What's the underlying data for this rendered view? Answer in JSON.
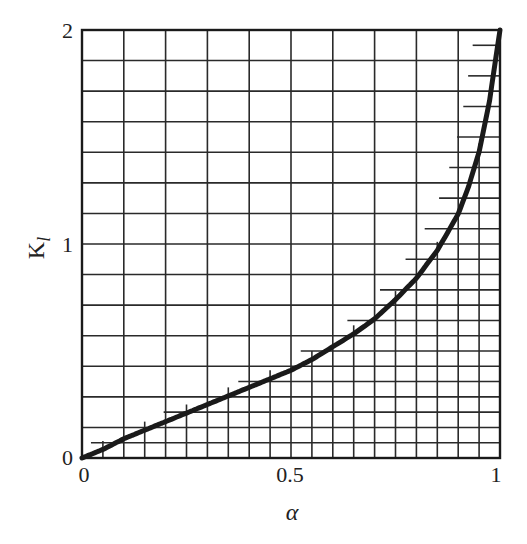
{
  "chart_data": {
    "type": "line",
    "title": "",
    "xlabel": "α",
    "ylabel": "K",
    "ylabel_subscript": "l",
    "xlim": [
      0,
      1
    ],
    "ylim": [
      0,
      2
    ],
    "x_ticks": [
      "0",
      "0.5",
      "1"
    ],
    "y_ticks": [
      "0",
      "1",
      "2"
    ],
    "grid": true,
    "grid_x_divisions": 10,
    "grid_y_divisions": 14,
    "fine_grid_under_curve": true,
    "series": [
      {
        "name": "K_l(α)",
        "x": [
          0,
          0.05,
          0.1,
          0.15,
          0.2,
          0.25,
          0.3,
          0.35,
          0.4,
          0.45,
          0.5,
          0.55,
          0.6,
          0.65,
          0.7,
          0.75,
          0.8,
          0.85,
          0.9,
          0.925,
          0.95,
          0.975,
          1.0
        ],
        "values": [
          0,
          0.04,
          0.09,
          0.13,
          0.17,
          0.21,
          0.25,
          0.29,
          0.33,
          0.37,
          0.41,
          0.46,
          0.52,
          0.58,
          0.65,
          0.74,
          0.84,
          0.97,
          1.14,
          1.27,
          1.43,
          1.67,
          2.0
        ]
      }
    ],
    "colors": {
      "curve": "#1a1a1a",
      "grid": "#2a2a2a"
    }
  }
}
